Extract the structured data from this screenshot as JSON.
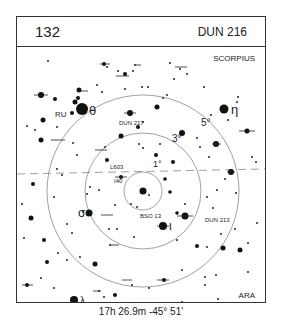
{
  "header": {
    "chart_number": "132",
    "object_name": "DUN 216"
  },
  "labels": {
    "constellation_top": "SCORPIUS",
    "constellation_bottom": "ARA",
    "ring_1": "1°",
    "ring_3": "3°",
    "ring_5": "5°",
    "stars": {
      "theta": "θ",
      "eta": "η",
      "sigma": "σ",
      "iota": "ι",
      "lambda": "λ",
      "ru": "RU"
    },
    "objects": {
      "dun217": "DUN 217",
      "dun213": "DUN 213",
      "bso13": "BSO 13",
      "l603": "L603",
      "i40": "I40"
    }
  },
  "caption": "17h 26.9m  -45° 51'"
}
